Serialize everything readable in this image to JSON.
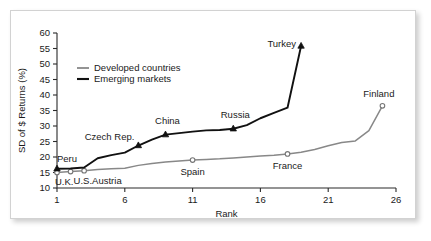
{
  "chart_data": {
    "type": "line",
    "title": "",
    "xlabel": "Rank",
    "ylabel": "SD of $ Returns (%)",
    "xlim": [
      1,
      26
    ],
    "ylim": [
      10,
      60
    ],
    "xticks": [
      1,
      6,
      11,
      16,
      21,
      26
    ],
    "yticks": [
      10,
      15,
      20,
      25,
      30,
      35,
      40,
      45,
      50,
      55,
      60
    ],
    "grid": false,
    "legend_position": "upper-left",
    "series": [
      {
        "name": "Developed countries",
        "color": "#888888",
        "marker": "open-circle",
        "x": [
          1,
          2,
          3,
          4,
          5,
          6,
          7,
          8,
          9,
          10,
          11,
          12,
          13,
          14,
          15,
          16,
          17,
          18,
          19,
          20,
          21,
          22,
          23,
          24,
          25
        ],
        "values": [
          15.0,
          15.3,
          15.6,
          16.0,
          16.2,
          16.4,
          17.3,
          17.9,
          18.4,
          18.7,
          19.0,
          19.2,
          19.4,
          19.7,
          20.0,
          20.3,
          20.6,
          21.0,
          21.5,
          22.4,
          23.6,
          24.7,
          25.2,
          28.5,
          36.5
        ]
      },
      {
        "name": "Emerging markets",
        "color": "#111111",
        "marker": "filled-triangle",
        "x": [
          1,
          2,
          3,
          4,
          5,
          6,
          7,
          8,
          9,
          10,
          11,
          12,
          13,
          14,
          15,
          16,
          17,
          18,
          19
        ],
        "values": [
          16.2,
          16.3,
          16.6,
          19.6,
          20.6,
          21.4,
          23.7,
          25.6,
          27.2,
          27.7,
          28.2,
          28.6,
          28.7,
          29.1,
          30.3,
          32.5,
          34.2,
          35.9,
          55.8
        ]
      }
    ],
    "annotations": [
      {
        "label": "Peru",
        "series": "Emerging markets",
        "x": 1,
        "y": 16.2,
        "anchor": "start",
        "dx": 0,
        "dy": -7
      },
      {
        "label": "U.K.",
        "series": "Developed countries",
        "x": 1,
        "y": 15.0,
        "anchor": "start",
        "dx": -2,
        "dy": 12
      },
      {
        "label": "U.S.",
        "series": "Developed countries",
        "x": 2,
        "y": 15.3,
        "anchor": "start",
        "dx": 3,
        "dy": 12
      },
      {
        "label": "Austria",
        "series": "Developed countries",
        "x": 3,
        "y": 15.6,
        "anchor": "start",
        "dx": 8,
        "dy": 13
      },
      {
        "label": "Czech Rep.",
        "series": "Emerging markets",
        "x": 7,
        "y": 23.7,
        "anchor": "end",
        "dx": -4,
        "dy": -6
      },
      {
        "label": "China",
        "series": "Emerging markets",
        "x": 9,
        "y": 27.2,
        "anchor": "middle",
        "dx": 2,
        "dy": -11
      },
      {
        "label": "Russia",
        "series": "Emerging markets",
        "x": 14,
        "y": 29.1,
        "anchor": "middle",
        "dx": 2,
        "dy": -11
      },
      {
        "label": "Turkey",
        "series": "Emerging markets",
        "x": 19,
        "y": 55.8,
        "anchor": "end",
        "dx": -5,
        "dy": 1
      },
      {
        "label": "Spain",
        "series": "Developed countries",
        "x": 11,
        "y": 19.0,
        "anchor": "middle",
        "dx": 0,
        "dy": 15
      },
      {
        "label": "France",
        "series": "Developed countries",
        "x": 18,
        "y": 21.0,
        "anchor": "middle",
        "dx": 0,
        "dy": 15
      },
      {
        "label": "Finland",
        "series": "Developed countries",
        "x": 25,
        "y": 36.5,
        "anchor": "end",
        "dx": 12,
        "dy": -9
      }
    ]
  },
  "legend": {
    "items": [
      {
        "label": "Developed countries"
      },
      {
        "label": "Emerging markets"
      }
    ]
  }
}
